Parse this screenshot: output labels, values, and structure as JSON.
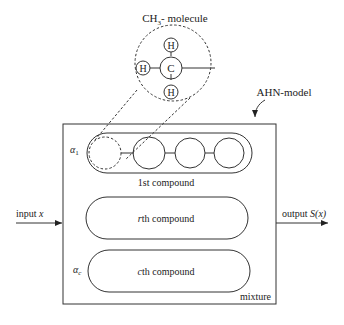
{
  "molecule_label": "CH3- molecule",
  "molecule_label_main": "CH",
  "molecule_label_sub": "3",
  "molecule_label_suffix": "- molecule",
  "atoms": {
    "center": "C",
    "top": "H",
    "left": "H",
    "bottom": "H"
  },
  "model_label": "AHN-model",
  "input_label": "input x",
  "input_label_main": "input ",
  "input_label_var": "x",
  "output_label_main": "output ",
  "output_label_var": "S(x)",
  "compounds": [
    {
      "weight": "α1",
      "weight_sym": "α",
      "weight_sub": "1",
      "label": "1st compound"
    },
    {
      "weight": "",
      "label_var": "r",
      "label_rest": "th compound"
    },
    {
      "weight": "αc",
      "weight_sym": "α",
      "weight_sub": "c",
      "label_var": "c",
      "label_rest": "th compound"
    }
  ],
  "container_label": "mixture"
}
